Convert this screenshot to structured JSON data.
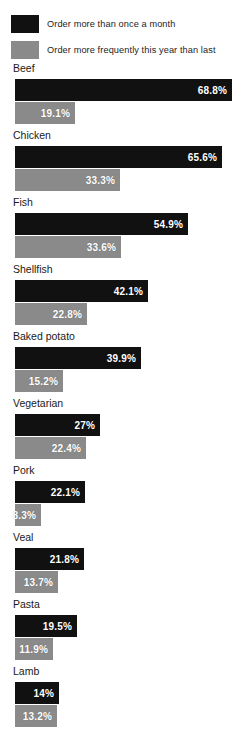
{
  "legend": {
    "items": [
      {
        "label": "Order more than once a month",
        "color": "#111111",
        "swatch_name": "legend-swatch-primary"
      },
      {
        "label": "Order more frequently this year than last",
        "color": "#8a8a8a",
        "swatch_name": "legend-swatch-secondary"
      }
    ]
  },
  "colors": {
    "primary": "#111111",
    "secondary": "#8a8a8a",
    "background": "#ffffff",
    "value_text": "#ffffff",
    "label_text": "#1a1a1a"
  },
  "chart_data": {
    "type": "bar",
    "title": "",
    "subtitle": "",
    "xlabel": "",
    "ylabel": "",
    "orientation": "horizontal",
    "grid": false,
    "legend_position": "top",
    "xlim": [
      0,
      68.8
    ],
    "categories": [
      "Beef",
      "Chicken",
      "Fish",
      "Shellfish",
      "Baked potato",
      "Vegetarian",
      "Pork",
      "Veal",
      "Pasta",
      "Lamb"
    ],
    "series": [
      {
        "name": "Order more than once a month",
        "color": "#111111",
        "values": [
          68.8,
          65.6,
          54.9,
          42.1,
          39.9,
          27,
          22.1,
          21.8,
          19.5,
          14
        ],
        "labels": [
          "68.8%",
          "65.6%",
          "54.9%",
          "42.1%",
          "39.9%",
          "27%",
          "22.1%",
          "21.8%",
          "19.5%",
          "14%"
        ]
      },
      {
        "name": "Order more frequently this year than last",
        "color": "#8a8a8a",
        "values": [
          19.1,
          33.3,
          33.6,
          22.8,
          15.2,
          22.4,
          8.3,
          13.7,
          11.9,
          13.2
        ],
        "labels": [
          "19.1%",
          "33.3%",
          "33.6%",
          "22.8%",
          "15.2%",
          "22.4%",
          "8.3%",
          "13.7%",
          "11.9%",
          "13.2%"
        ]
      }
    ]
  }
}
